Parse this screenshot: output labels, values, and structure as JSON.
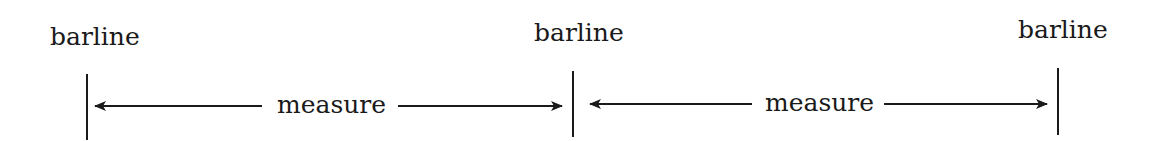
{
  "diagram": {
    "type": "music-notation-measure",
    "barlines": [
      {
        "label": "barline",
        "x": 87,
        "y1": 74,
        "y2": 140,
        "label_left": 50,
        "label_top": 24
      },
      {
        "label": "barline",
        "x": 573,
        "y1": 71,
        "y2": 137,
        "label_left": 534,
        "label_top": 20
      },
      {
        "label": "barline",
        "x": 1058,
        "y1": 68,
        "y2": 135,
        "label_left": 1018,
        "label_top": 17
      }
    ],
    "measures": [
      {
        "label": "measure",
        "y": 106,
        "arrow_left_start": 262,
        "arrow_left_end": 95,
        "arrow_right_start": 398,
        "arrow_right_end": 562,
        "label_left": 277,
        "label_top": 92
      },
      {
        "label": "measure",
        "y": 104,
        "arrow_left_start": 752,
        "arrow_left_end": 590,
        "arrow_right_start": 884,
        "arrow_right_end": 1047,
        "label_left": 765,
        "label_top": 90
      }
    ],
    "colors": {
      "ink": "#1a1a1a",
      "background": "#ffffff"
    }
  }
}
